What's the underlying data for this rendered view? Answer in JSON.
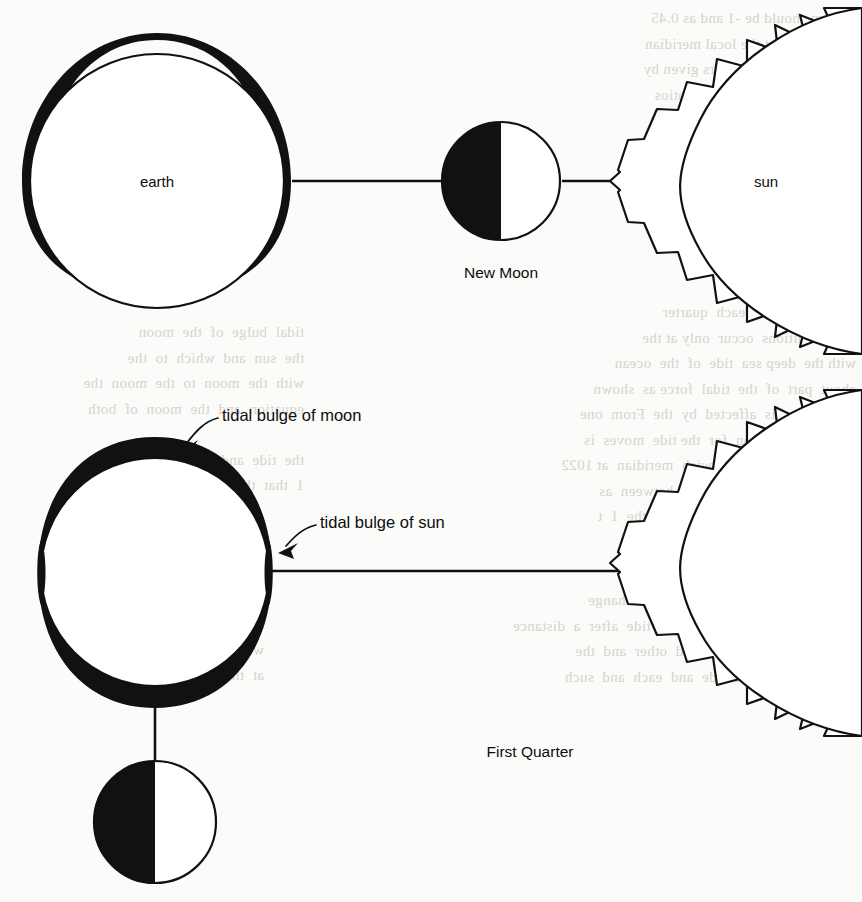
{
  "figure": {
    "panels": [
      {
        "id": "new-moon",
        "phase_label": "New Moon",
        "earth_label": "earth",
        "sun_label": "sun",
        "bulge_orientation": "horizontal",
        "description": "Earth with tidal bulges aligned toward the moon and sun, moon between earth and sun"
      },
      {
        "id": "first-quarter",
        "phase_label": "First Quarter",
        "earth_label": "",
        "sun_label": "",
        "bulge_orientation": "vertical",
        "callouts": [
          "tidal bulge of moon",
          "tidal bulge of sun"
        ],
        "description": "Earth with large vertical moon bulges and small horizontal sun bulges, moon below earth at right angle to sun"
      }
    ],
    "colors": {
      "ink": "#111111",
      "paper": "#fbfbf9",
      "ghost_text": "#cfcbc4"
    }
  },
  "labels": {
    "earth": "earth",
    "sun": "sun",
    "new_moon": "New Moon",
    "first_quarter": "First Quarter",
    "tidal_bulge_of_moon": "tidal bulge of moon",
    "tidal_bulge_of_sun": "tidal bulge of sun"
  },
  "background_text": {
    "right_block_1": "the sun should be -1 and as 0.45\nis occurring at the local meridian\nsolar system parameters given by\nmuch as  when  1 and the ratios\nsolar radiation  the the  1 or the\nthe  in  the  reciprocal  and  the\non  the  Earth  is  computed  from\nparameter  on  the visible  density",
    "right_block_2": "Tides  and  with  each  quarter\nthe  conditions  occur  only at the\nwith the  deep sea  tide  of  the  ocean\nabout  part  of  the  tidal  force as  shown\ntidal  range  is  affected  by  the  From  one\nmeasured  solution  for  the tide  moves  is\nrelative  to  the  Greenwich  meridian  at 1022\nH  certain  the  same  value  between  as\nend  and  therefore  position  of  the  1  t",
    "right_block_3": "A  perfect  period  of  the  sea  to  change\nwhich  a  near  enough  to  the  tide  after  a  distance\non  the  moon  of  0.14  and  other  and  the\nthe  period  of  the  tide  and  each  and  such",
    "left_block_1": "tidal  bulge  of  the  moon\nthe  sun  and  which  to  the\nwith  the  moon  to  the  moon  the\nequation  and  the  moon  of  both\n\nthe  tide  and  the  sun  to  the\n1  that  the  tide  of  the",
    "left_block_2": "spring  tide  and  the\nwith  neap  tide  the\nat  the  time  the"
  }
}
